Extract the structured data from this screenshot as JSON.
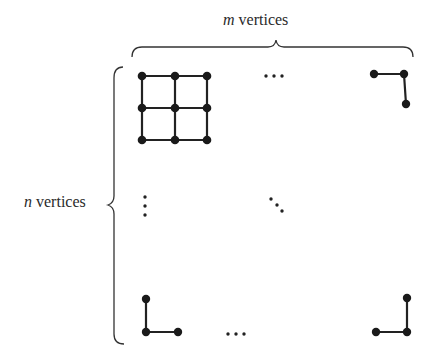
{
  "labels": {
    "top": {
      "variable": "m",
      "text": " vertices"
    },
    "left": {
      "variable": "n",
      "text": " vertices"
    }
  },
  "colors": {
    "ink": "#222222",
    "background": "#ffffff"
  },
  "grid_graph": {
    "description": "m x n grid graph; top-left corner shows a 3x3 block of vertices",
    "top_left_block": {
      "rows": 3,
      "cols": 3,
      "xs": [
        142,
        175,
        207
      ],
      "ys": [
        76,
        108,
        140
      ]
    },
    "corners": {
      "top_right": [
        [
          374,
          74
        ],
        [
          404,
          74
        ],
        [
          406,
          104
        ]
      ],
      "bottom_left": [
        [
          146,
          299
        ],
        [
          146,
          332
        ],
        [
          178,
          332
        ]
      ],
      "bottom_right": [
        [
          376,
          332
        ],
        [
          407,
          332
        ],
        [
          407,
          298
        ]
      ]
    },
    "ellipses": {
      "top_horizontal": "...",
      "bottom_horizontal": "...",
      "left_vertical": "⋮",
      "center_diagonal": "⋱"
    }
  }
}
